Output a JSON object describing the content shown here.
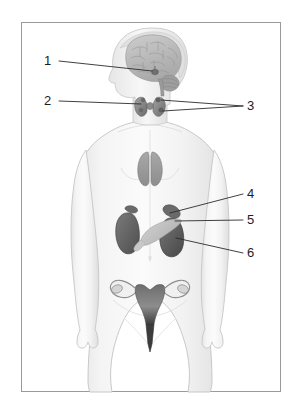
{
  "figure": {
    "border_color": "#9a9a9a",
    "background_color": "#ffffff",
    "body_fill": "#f2f2f2",
    "body_outline": "#c9c9c9",
    "label_color": "#1d1d1d",
    "leader_color": "#2b2b2b"
  },
  "labels": [
    {
      "id": "1",
      "text": "1",
      "target": "pituitary-gland",
      "x": 47,
      "y": 58
    },
    {
      "id": "2",
      "text": "2",
      "target": "thyroid-gland",
      "x": 47,
      "y": 97
    },
    {
      "id": "3",
      "text": "3",
      "target": "parathyroid-glands",
      "x": 249,
      "y": 102
    },
    {
      "id": "4",
      "text": "4",
      "target": "adrenal-gland",
      "x": 249,
      "y": 193
    },
    {
      "id": "5",
      "text": "5",
      "target": "pancreas",
      "x": 249,
      "y": 218
    },
    {
      "id": "6",
      "text": "6",
      "target": "kidney",
      "x": 249,
      "y": 252
    }
  ],
  "organs": [
    {
      "name": "brain",
      "fill": "#b9b9b9"
    },
    {
      "name": "pituitary-gland",
      "fill": "#6f6f6f"
    },
    {
      "name": "thyroid-gland",
      "fill": "#8a8a8a"
    },
    {
      "name": "parathyroid-glands",
      "fill": "#707070"
    },
    {
      "name": "thymus",
      "fill": "#9e9e9e"
    },
    {
      "name": "adrenal-gland-left",
      "fill": "#6a6a6a"
    },
    {
      "name": "adrenal-gland-right",
      "fill": "#6a6a6a"
    },
    {
      "name": "pancreas",
      "fill": "#c2c2c2"
    },
    {
      "name": "kidney-left",
      "fill": "#5f5f5f"
    },
    {
      "name": "kidney-right",
      "fill": "#5a5a5a"
    },
    {
      "name": "uterus",
      "fill": "#8f8f8f"
    },
    {
      "name": "ovary-left",
      "fill": "#cfcfcf"
    },
    {
      "name": "ovary-right",
      "fill": "#cfcfcf"
    }
  ]
}
